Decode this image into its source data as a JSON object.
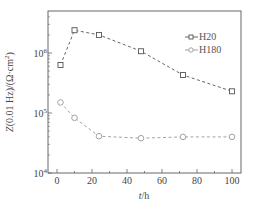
{
  "chart_data": {
    "type": "line",
    "title": "",
    "xlabel": "t/h",
    "ylabel": "Z(0.01 Hz)/(Ω·cm²)",
    "x_ticks": [
      0,
      20,
      40,
      60,
      80,
      100
    ],
    "x_tick_labels": [
      "0",
      "20",
      "40",
      "60",
      "80",
      "100"
    ],
    "xlim": [
      -5,
      105
    ],
    "y_scale": "log",
    "y_ticks": [
      10000,
      100000,
      1000000
    ],
    "y_tick_labels": [
      {
        "base": "10",
        "exp": "4"
      },
      {
        "base": "10",
        "exp": "5"
      },
      {
        "base": "10",
        "exp": "6"
      }
    ],
    "ylim": [
      10000,
      4800000
    ],
    "grid": false,
    "legend_position": "upper right",
    "series": [
      {
        "name": "H20",
        "marker": "square",
        "line_style": "dashed",
        "color": "#555555",
        "x": [
          2,
          10,
          24,
          48,
          72,
          100
        ],
        "values": [
          630000,
          2400000,
          2000000,
          1070000,
          430000,
          230000
        ]
      },
      {
        "name": "H180",
        "marker": "circle",
        "line_style": "dashed",
        "color": "#999999",
        "x": [
          2,
          10,
          24,
          48,
          72,
          100
        ],
        "values": [
          150000,
          83000,
          41000,
          38000,
          40000,
          40000
        ]
      }
    ]
  },
  "legend": {
    "items": [
      {
        "label": "H20"
      },
      {
        "label": "H180"
      }
    ]
  },
  "axes": {
    "xlabel_italic": "t",
    "xlabel_rest": "/h",
    "ylabel_italic": "Z",
    "ylabel_rest": "(0.01 Hz)/(Ω·cm",
    "ylabel_sup": "2",
    "ylabel_close": ")"
  }
}
